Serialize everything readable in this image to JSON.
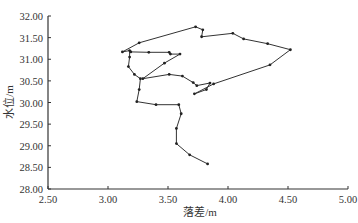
{
  "chart_data": {
    "type": "line",
    "title": "",
    "xlabel": "落差/m",
    "ylabel": "水位/m",
    "xlim": [
      2.5,
      5.0
    ],
    "ylim": [
      28.0,
      32.0
    ],
    "x_ticks": [
      "2.50",
      "3.00",
      "3.50",
      "4.00",
      "4.50",
      "5.00"
    ],
    "y_ticks": [
      "28.00",
      "28.50",
      "29.00",
      "29.50",
      "30.00",
      "30.50",
      "31.00",
      "31.50",
      "32.00"
    ],
    "grid": false,
    "legend": null,
    "series": [
      {
        "name": "水位-落差关系",
        "color": "#333333",
        "marker": "dot",
        "points": [
          [
            3.83,
            28.58
          ],
          [
            3.68,
            28.79
          ],
          [
            3.57,
            29.05
          ],
          [
            3.57,
            29.4
          ],
          [
            3.61,
            29.74
          ],
          [
            3.59,
            29.95
          ],
          [
            3.4,
            29.95
          ],
          [
            3.24,
            30.02
          ],
          [
            3.26,
            30.3
          ],
          [
            3.27,
            30.55
          ],
          [
            3.22,
            30.65
          ],
          [
            3.17,
            30.83
          ],
          [
            3.18,
            31.05
          ],
          [
            3.18,
            31.2
          ],
          [
            3.12,
            31.17
          ],
          [
            3.26,
            31.38
          ],
          [
            3.73,
            31.75
          ],
          [
            3.79,
            31.68
          ],
          [
            3.78,
            31.52
          ],
          [
            4.04,
            31.6
          ],
          [
            4.13,
            31.47
          ],
          [
            4.33,
            31.36
          ],
          [
            4.52,
            31.22
          ],
          [
            4.35,
            30.87
          ],
          [
            3.88,
            30.43
          ],
          [
            3.72,
            30.2
          ],
          [
            3.82,
            30.3
          ],
          [
            3.85,
            30.45
          ],
          [
            3.74,
            30.39
          ],
          [
            3.71,
            30.46
          ],
          [
            3.62,
            30.61
          ],
          [
            3.51,
            30.65
          ],
          [
            3.29,
            30.55
          ],
          [
            3.47,
            30.91
          ],
          [
            3.6,
            31.12
          ],
          [
            3.52,
            31.12
          ],
          [
            3.51,
            31.16
          ],
          [
            3.34,
            31.16
          ],
          [
            3.19,
            31.17
          ]
        ]
      }
    ]
  }
}
